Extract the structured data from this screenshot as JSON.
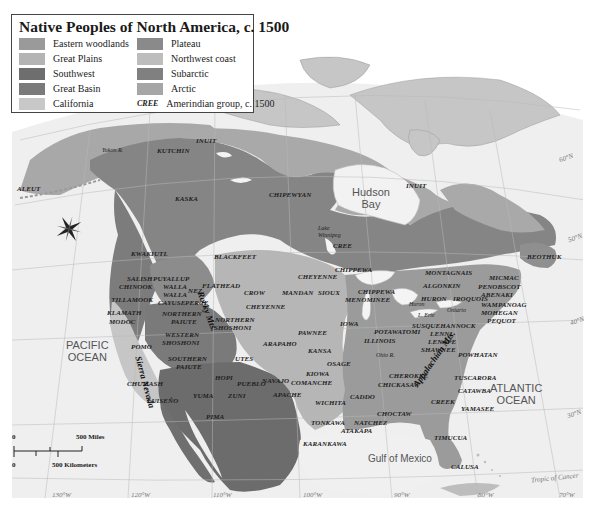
{
  "legend": {
    "title": "Native Peoples of North America, c. 1500",
    "items": [
      {
        "label": "Eastern woodlands",
        "color": "#9a9a9a"
      },
      {
        "label": "Great Plains",
        "color": "#b4b4b4"
      },
      {
        "label": "Southwest",
        "color": "#6e6e6e"
      },
      {
        "label": "Great Basin",
        "color": "#7a7a7a"
      },
      {
        "label": "California",
        "color": "#c8c8c8"
      },
      {
        "label": "Plateau",
        "color": "#8a8a8a"
      },
      {
        "label": "Northwest coast",
        "color": "#bdbdbd"
      },
      {
        "label": "Subarctic",
        "color": "#808080"
      },
      {
        "label": "Arctic",
        "color": "#a6a6a6"
      }
    ],
    "group_code": "CREE",
    "group_label": "Amerindian group, c. 1500"
  },
  "groups": [
    {
      "name": "INUIT",
      "x": 196,
      "y": 137
    },
    {
      "name": "KUTCHIN",
      "x": 157,
      "y": 147
    },
    {
      "name": "ALEUT",
      "x": 17,
      "y": 185
    },
    {
      "name": "KASKA",
      "x": 175,
      "y": 195
    },
    {
      "name": "CHIPEWYAN",
      "x": 269,
      "y": 191
    },
    {
      "name": "INUIT",
      "x": 406,
      "y": 182
    },
    {
      "name": "CREE",
      "x": 333,
      "y": 242
    },
    {
      "name": "BEOTHUK",
      "x": 527,
      "y": 253
    },
    {
      "name": "KWAKIUTL",
      "x": 131,
      "y": 250
    },
    {
      "name": "BLACKFEET",
      "x": 214,
      "y": 253
    },
    {
      "name": "SALISH",
      "x": 127,
      "y": 275
    },
    {
      "name": "CHINOOK",
      "x": 119,
      "y": 283
    },
    {
      "name": "PUYALLUP",
      "x": 153,
      "y": 275
    },
    {
      "name": "WALLA",
      "x": 163,
      "y": 283
    },
    {
      "name": "WALLA",
      "x": 163,
      "y": 291
    },
    {
      "name": "NEZ",
      "x": 188,
      "y": 287
    },
    {
      "name": "CAYUSE",
      "x": 158,
      "y": 299
    },
    {
      "name": "PERCE",
      "x": 185,
      "y": 299
    },
    {
      "name": "TILLAMOOK",
      "x": 111,
      "y": 296
    },
    {
      "name": "FLATHEAD",
      "x": 202,
      "y": 282
    },
    {
      "name": "CROW",
      "x": 244,
      "y": 289
    },
    {
      "name": "MANDAN",
      "x": 282,
      "y": 289
    },
    {
      "name": "CHEYENNE",
      "x": 298,
      "y": 273
    },
    {
      "name": "SIOUX",
      "x": 318,
      "y": 289
    },
    {
      "name": "CHIPPEWA",
      "x": 335,
      "y": 266
    },
    {
      "name": "CHIPPEWA",
      "x": 358,
      "y": 288
    },
    {
      "name": "MENOMINEE",
      "x": 345,
      "y": 296
    },
    {
      "name": "MONTAGNAIS",
      "x": 425,
      "y": 269
    },
    {
      "name": "ALGONKIN",
      "x": 423,
      "y": 282
    },
    {
      "name": "HURON",
      "x": 421,
      "y": 295
    },
    {
      "name": "IROQUOIS",
      "x": 453,
      "y": 295
    },
    {
      "name": "MICMAC",
      "x": 489,
      "y": 274
    },
    {
      "name": "PENOBSCOT",
      "x": 478,
      "y": 283
    },
    {
      "name": "ABENAKI",
      "x": 481,
      "y": 291
    },
    {
      "name": "WAMPANOAG",
      "x": 481,
      "y": 301
    },
    {
      "name": "MOHEGAN",
      "x": 481,
      "y": 309
    },
    {
      "name": "PEQUOT",
      "x": 487,
      "y": 317
    },
    {
      "name": "CHEYENNE",
      "x": 246,
      "y": 303
    },
    {
      "name": "KLAMATH",
      "x": 107,
      "y": 309
    },
    {
      "name": "MODOC",
      "x": 109,
      "y": 318
    },
    {
      "name": "NORTHERN",
      "x": 162,
      "y": 310
    },
    {
      "name": "PAIUTE",
      "x": 171,
      "y": 318
    },
    {
      "name": "NORTHERN",
      "x": 215,
      "y": 316
    },
    {
      "name": "SHOSHONI",
      "x": 214,
      "y": 324
    },
    {
      "name": "IOWA",
      "x": 340,
      "y": 320
    },
    {
      "name": "POTAWATOMI",
      "x": 374,
      "y": 328
    },
    {
      "name": "SUSQUEHANNOCK",
      "x": 412,
      "y": 322
    },
    {
      "name": "LENNI",
      "x": 430,
      "y": 330
    },
    {
      "name": "LENAPE",
      "x": 428,
      "y": 338
    },
    {
      "name": "SHAWNEE",
      "x": 421,
      "y": 346
    },
    {
      "name": "PAWNEE",
      "x": 298,
      "y": 329
    },
    {
      "name": "WESTERN",
      "x": 165,
      "y": 331
    },
    {
      "name": "SHOSHONI",
      "x": 162,
      "y": 339
    },
    {
      "name": "POMO",
      "x": 131,
      "y": 343
    },
    {
      "name": "ARAPAHO",
      "x": 263,
      "y": 340
    },
    {
      "name": "ILLINOIS",
      "x": 364,
      "y": 337
    },
    {
      "name": "KANSA",
      "x": 308,
      "y": 347
    },
    {
      "name": "POWHATAN",
      "x": 458,
      "y": 351
    },
    {
      "name": "SOUTHERN",
      "x": 168,
      "y": 355
    },
    {
      "name": "PAIUTE",
      "x": 176,
      "y": 363
    },
    {
      "name": "UTES",
      "x": 235,
      "y": 355
    },
    {
      "name": "OSAGE",
      "x": 327,
      "y": 360
    },
    {
      "name": "HOPI",
      "x": 215,
      "y": 374
    },
    {
      "name": "PUEBLO",
      "x": 237,
      "y": 380
    },
    {
      "name": "NAVAJO",
      "x": 262,
      "y": 377
    },
    {
      "name": "KIOWA",
      "x": 306,
      "y": 370
    },
    {
      "name": "COMANCHE",
      "x": 291,
      "y": 379
    },
    {
      "name": "CHEROKEE",
      "x": 389,
      "y": 372
    },
    {
      "name": "CHICKASAW",
      "x": 378,
      "y": 381
    },
    {
      "name": "TUSCARORA",
      "x": 454,
      "y": 374
    },
    {
      "name": "CHUMASH",
      "x": 127,
      "y": 380
    },
    {
      "name": "YUMA",
      "x": 193,
      "y": 392
    },
    {
      "name": "ZUNI",
      "x": 228,
      "y": 392
    },
    {
      "name": "APACHE",
      "x": 273,
      "y": 391
    },
    {
      "name": "CADDO",
      "x": 350,
      "y": 393
    },
    {
      "name": "WICHITA",
      "x": 315,
      "y": 399
    },
    {
      "name": "CATAWBA",
      "x": 458,
      "y": 387
    },
    {
      "name": "CREEK",
      "x": 431,
      "y": 398
    },
    {
      "name": "YAMASEE",
      "x": 461,
      "y": 405
    },
    {
      "name": "LUISEÑO",
      "x": 147,
      "y": 397
    },
    {
      "name": "PIMA",
      "x": 206,
      "y": 413
    },
    {
      "name": "CHOCTAW",
      "x": 377,
      "y": 410
    },
    {
      "name": "TONKAWA",
      "x": 311,
      "y": 419
    },
    {
      "name": "NATCHEZ",
      "x": 354,
      "y": 419
    },
    {
      "name": "ATAKAPA",
      "x": 341,
      "y": 427
    },
    {
      "name": "TIMUCUA",
      "x": 434,
      "y": 434
    },
    {
      "name": "KARANKAWA",
      "x": 303,
      "y": 440
    },
    {
      "name": "CALUSA",
      "x": 451,
      "y": 463
    }
  ],
  "rivers": [
    {
      "name": "Yukon R.",
      "x": 102,
      "y": 147
    },
    {
      "name": "Lake",
      "x": 318,
      "y": 225
    },
    {
      "name": "Winnipeg",
      "x": 318,
      "y": 232
    },
    {
      "name": "Ohio R.",
      "x": 376,
      "y": 352
    },
    {
      "name": "L. Erie",
      "x": 418,
      "y": 312
    },
    {
      "name": "Ontario",
      "x": 447,
      "y": 307
    },
    {
      "name": "Huron",
      "x": 409,
      "y": 301
    }
  ],
  "mountains": [
    {
      "name": "Rocky Mts.",
      "x": 205,
      "y": 290
    },
    {
      "name": "Sierra Nevada",
      "x": 143,
      "y": 355
    },
    {
      "name": "Appalachian Mts.",
      "x": 411,
      "y": 383
    }
  ],
  "water_labels": [
    {
      "name": "Hudson",
      "sub": "Bay",
      "x": 352,
      "y": 186,
      "size": 11
    },
    {
      "name": "PACIFIC",
      "sub": "OCEAN",
      "x": 66,
      "y": 339,
      "size": 11
    },
    {
      "name": "ATLANTIC",
      "sub": "OCEAN",
      "x": 490,
      "y": 382,
      "size": 11
    },
    {
      "name": "Gulf of Mexico",
      "sub": "",
      "x": 368,
      "y": 453,
      "size": 10
    }
  ],
  "gridlines": [
    {
      "label": "130°W",
      "x": 52,
      "y": 491
    },
    {
      "label": "120°W",
      "x": 131,
      "y": 491
    },
    {
      "label": "110°W",
      "x": 213,
      "y": 491
    },
    {
      "label": "100°W",
      "x": 303,
      "y": 491
    },
    {
      "label": "90°W",
      "x": 394,
      "y": 491
    },
    {
      "label": "80°W",
      "x": 478,
      "y": 491
    },
    {
      "label": "70°W",
      "x": 559,
      "y": 491
    },
    {
      "label": "60°N",
      "x": 559,
      "y": 154
    },
    {
      "label": "50°N",
      "x": 568,
      "y": 234
    },
    {
      "label": "40°N",
      "x": 570,
      "y": 317
    },
    {
      "label": "30°N",
      "x": 567,
      "y": 410
    },
    {
      "label": "Tropic of Cancer",
      "x": 531,
      "y": 474
    }
  ],
  "scale": {
    "miles_label": "500 Miles",
    "km_label": "500 Kilometers",
    "zero": "0"
  }
}
